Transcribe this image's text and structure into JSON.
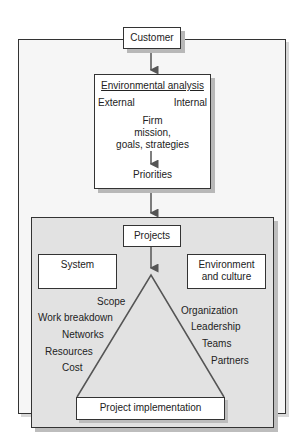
{
  "diagram": {
    "customer": "Customer",
    "environmental_analysis": {
      "title": "Environmental analysis",
      "external": "External",
      "internal": "Internal",
      "firm_line1": "Firm",
      "firm_line2": "mission,",
      "firm_line3": "goals, strategies",
      "priorities": "Priorities"
    },
    "projects": "Projects",
    "system": "System",
    "environment_line1": "Environment",
    "environment_line2": "and culture",
    "left_side": [
      "Scope",
      "Work breakdown",
      "Networks",
      "Resources",
      "Cost"
    ],
    "right_side": [
      "Organization",
      "Leadership",
      "Teams",
      "Partners"
    ],
    "project_implementation": "Project implementation"
  }
}
